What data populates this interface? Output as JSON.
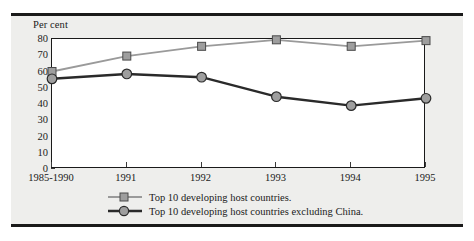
{
  "chart_data": {
    "type": "line",
    "title": "",
    "xlabel": "",
    "ylabel": "Per cent",
    "ylim": [
      0,
      80
    ],
    "yticks": [
      0,
      10,
      20,
      30,
      40,
      50,
      60,
      70,
      80
    ],
    "grid": false,
    "legend_position": "bottom",
    "categories": [
      "1985-1990",
      "1991",
      "1992",
      "1993",
      "1994",
      "1995"
    ],
    "series": [
      {
        "name": "Top 10 developing host countries.",
        "values": [
          60,
          69.5,
          75.5,
          79.5,
          75.5,
          79
        ],
        "color": "#9a9a9a",
        "marker": "square"
      },
      {
        "name": "Top 10 developing host countries excluding China.",
        "values": [
          55.5,
          58.5,
          56.5,
          44.5,
          39,
          43.5
        ],
        "color": "#2a2a2a",
        "marker": "circle"
      }
    ]
  },
  "axis": {
    "y_title": "Per cent"
  },
  "legend": {
    "items": [
      {
        "label": "Top 10 developing host countries."
      },
      {
        "label": "Top 10 developing host countries excluding China."
      }
    ]
  },
  "colors": {
    "series_light": "#9a9a9a",
    "series_dark": "#2a2a2a",
    "marker_fill": "#9e9e9e",
    "panel_bg": "#eeeeec",
    "plot_bg": "#ffffff",
    "axis": "#1a1a1a",
    "rule": "#1a1a1a"
  }
}
